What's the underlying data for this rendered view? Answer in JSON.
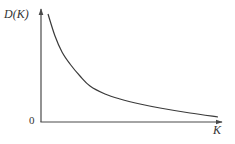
{
  "chart_data": {
    "type": "line",
    "title": "",
    "xlabel": "K",
    "ylabel": "D(K)",
    "origin_label": "0",
    "grid": false,
    "legend": null,
    "axis_ticks": "none",
    "series": [
      {
        "name": "D(K)",
        "x": [
          0.05,
          0.12,
          0.2,
          0.3,
          0.45,
          0.65,
          1.0
        ],
        "y": [
          0.98,
          0.62,
          0.4,
          0.27,
          0.17,
          0.1,
          0.05
        ]
      }
    ],
    "pixel_curve": [
      [
        48,
        14
      ],
      [
        55,
        36
      ],
      [
        62,
        52
      ],
      [
        70,
        64
      ],
      [
        80,
        76
      ],
      [
        90,
        86
      ],
      [
        105,
        94
      ],
      [
        120,
        99
      ],
      [
        140,
        104
      ],
      [
        160,
        108
      ],
      [
        190,
        113
      ],
      [
        218,
        117
      ]
    ],
    "colors": {
      "axis": "#4a4a4a",
      "curve": "#3a3a3a",
      "text": "#333333"
    }
  }
}
